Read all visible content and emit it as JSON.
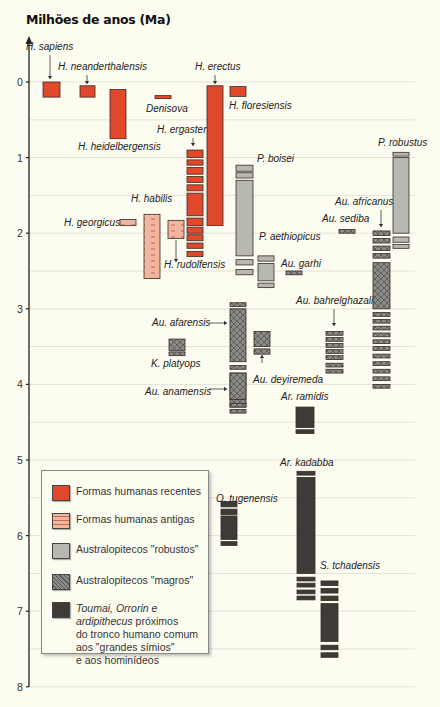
{
  "header": {
    "y_axis_title": "Milhões de anos (Ma)",
    "partial_title_visible": "cut-off red title at top (text not legible)"
  },
  "colors": {
    "background": "#fdfcf0",
    "recent_human": "#e0492c",
    "ancient_human": "#f2b5a0",
    "robust_australopith": "#b8b8b2",
    "gracile_australopith": "#8a8a86",
    "ancestral": "#3e3a38",
    "gridline": "#dcdcd0",
    "axis": "#222222"
  },
  "legend": {
    "items": [
      {
        "key": "recent",
        "label": "Formas humanas recentes"
      },
      {
        "key": "ancient",
        "label": "Formas humanas antigas"
      },
      {
        "key": "robust",
        "label": "Australopitecos \"robustos\""
      },
      {
        "key": "gracile",
        "label": "Australopitecos \"magros\""
      },
      {
        "key": "ancestral",
        "label_lines": [
          "Toumai, Orrorin e",
          "ardipithecus próximos",
          "do tronco humano comum",
          "aos \"grandes símios\"",
          "e aos hominídeos"
        ]
      }
    ]
  },
  "chart_data": {
    "type": "range-bar timeline",
    "title": "",
    "ylabel": "Milhões de anos (Ma)",
    "xlabel": "",
    "ylim": [
      0,
      8
    ],
    "y_inverted": true,
    "y_ticks": [
      "0",
      "1",
      "2",
      "3",
      "4",
      "5",
      "6",
      "7",
      "8"
    ],
    "grid": "horizontal lines every 0.5 Ma",
    "legend_position": "bottom-left inset",
    "species": [
      {
        "name": "H. sapiens",
        "group": "recent",
        "segments": [
          [
            0.0,
            0.2
          ]
        ],
        "label_pos": "above-arrow"
      },
      {
        "name": "H. neanderthalensis",
        "group": "recent",
        "segments": [
          [
            0.05,
            0.2
          ]
        ],
        "label_pos": "above-arrow"
      },
      {
        "name": "H. heidelbergensis",
        "group": "recent",
        "segments": [
          [
            0.1,
            0.75
          ]
        ],
        "label_pos": "below"
      },
      {
        "name": "Denisova",
        "group": "recent",
        "segments": [
          [
            0.18,
            0.22
          ]
        ],
        "label_pos": "below"
      },
      {
        "name": "H. erectus",
        "group": "recent",
        "segments": [
          [
            0.05,
            1.9
          ]
        ],
        "label_pos": "above-arrow"
      },
      {
        "name": "H. floresiensis",
        "group": "recent",
        "segments": [
          [
            0.06,
            0.19
          ]
        ],
        "label_pos": "below"
      },
      {
        "name": "H. ergaster",
        "group": "recent",
        "segments": [
          [
            0.9,
            1.0
          ],
          [
            1.03,
            1.1
          ],
          [
            1.13,
            1.22
          ],
          [
            1.25,
            1.33
          ],
          [
            1.36,
            1.44
          ],
          [
            1.47,
            1.77
          ],
          [
            1.8,
            1.9
          ],
          [
            1.92,
            2.0
          ],
          [
            2.02,
            2.1
          ],
          [
            2.13,
            2.2
          ],
          [
            2.24,
            2.31
          ]
        ],
        "label_pos": "above-arrow"
      },
      {
        "name": "H. habilis",
        "group": "ancient",
        "segments": [
          [
            1.75,
            2.6
          ]
        ],
        "label_pos": "above"
      },
      {
        "name": "H. georgicus",
        "group": "ancient",
        "segments": [
          [
            1.82,
            1.9
          ]
        ],
        "label_pos": "left"
      },
      {
        "name": "H. rudolfensis",
        "group": "ancient",
        "segments": [
          [
            1.83,
            2.07
          ]
        ],
        "label_pos": "below-arrow"
      },
      {
        "name": "P. boisei",
        "group": "robust",
        "segments": [
          [
            1.1,
            1.18
          ],
          [
            1.2,
            1.27
          ],
          [
            1.3,
            2.3
          ],
          [
            2.35,
            2.42
          ],
          [
            2.48,
            2.55
          ]
        ],
        "label_pos": "above"
      },
      {
        "name": "P. aethiopicus",
        "group": "robust",
        "segments": [
          [
            2.3,
            2.37
          ],
          [
            2.4,
            2.63
          ],
          [
            2.66,
            2.72
          ]
        ],
        "label_pos": "above"
      },
      {
        "name": "Au. garhi",
        "group": "gracile",
        "segments": [
          [
            2.5,
            2.55
          ]
        ],
        "label_pos": "right"
      },
      {
        "name": "Au. sediba",
        "group": "gracile",
        "segments": [
          [
            1.95,
            2.0
          ]
        ],
        "label_pos": "above"
      },
      {
        "name": "P. robustus",
        "group": "robust",
        "segments": [
          [
            0.93,
            0.98
          ],
          [
            1.0,
            2.0
          ],
          [
            2.05,
            2.12
          ],
          [
            2.15,
            2.2
          ]
        ],
        "label_pos": "above"
      },
      {
        "name": "Au. africanus",
        "group": "gracile",
        "segments": [
          [
            1.97,
            2.03
          ],
          [
            2.07,
            2.13
          ],
          [
            2.17,
            2.23
          ],
          [
            2.27,
            2.33
          ],
          [
            2.39,
            3.0
          ],
          [
            3.05,
            3.1
          ],
          [
            3.14,
            3.19
          ],
          [
            3.23,
            3.28
          ],
          [
            3.32,
            3.37
          ],
          [
            3.41,
            3.46
          ],
          [
            3.5,
            3.55
          ],
          [
            3.6,
            3.65
          ],
          [
            3.7,
            3.75
          ],
          [
            3.8,
            3.85
          ],
          [
            3.9,
            3.95
          ],
          [
            4.0,
            4.05
          ]
        ],
        "label_pos": "above-arrow"
      },
      {
        "name": "Au. bahrelghazali",
        "group": "gracile",
        "segments": [
          [
            3.3,
            3.35
          ],
          [
            3.38,
            3.43
          ],
          [
            3.46,
            3.51
          ],
          [
            3.54,
            3.59
          ],
          [
            3.62,
            3.67
          ],
          [
            3.72,
            3.77
          ],
          [
            3.8,
            3.85
          ]
        ],
        "label_pos": "above-arrow"
      },
      {
        "name": "Au. afarensis",
        "group": "gracile",
        "segments": [
          [
            2.92,
            2.97
          ],
          [
            3.0,
            3.7
          ],
          [
            3.75,
            3.8
          ],
          [
            3.85,
            4.3
          ]
        ],
        "label_pos": "left-arrow"
      },
      {
        "name": "Au. anamensis",
        "group": "gracile",
        "segments": [
          [
            3.85,
            4.2
          ],
          [
            4.25,
            4.3
          ],
          [
            4.33,
            4.38
          ]
        ],
        "label_pos": "left-arrow"
      },
      {
        "name": "K. platyops",
        "group": "gracile",
        "segments": [
          [
            3.4,
            3.55
          ],
          [
            3.57,
            3.62
          ]
        ],
        "label_pos": "below"
      },
      {
        "name": "Au. deyiremeda",
        "group": "gracile",
        "segments": [
          [
            3.3,
            3.5
          ],
          [
            3.53,
            3.6
          ]
        ],
        "label_pos": "below-arrow"
      },
      {
        "name": "Ar. ramidis",
        "group": "ancestral",
        "segments": [
          [
            4.3,
            4.57
          ],
          [
            4.6,
            4.65
          ]
        ],
        "label_pos": "above"
      },
      {
        "name": "Ar. kadabba",
        "group": "ancestral",
        "segments": [
          [
            5.15,
            5.2
          ],
          [
            5.23,
            6.5
          ],
          [
            6.55,
            6.6
          ],
          [
            6.63,
            6.68
          ],
          [
            6.72,
            6.77
          ],
          [
            6.8,
            6.85
          ]
        ],
        "label_pos": "above"
      },
      {
        "name": "O. tugenensis",
        "group": "ancestral",
        "segments": [
          [
            5.55,
            5.62
          ],
          [
            5.65,
            5.72
          ],
          [
            5.74,
            6.05
          ],
          [
            6.08,
            6.13
          ]
        ],
        "label_pos": "above"
      },
      {
        "name": "S. tchadensis",
        "group": "ancestral",
        "segments": [
          [
            6.6,
            6.66
          ],
          [
            6.7,
            6.76
          ],
          [
            6.8,
            6.86
          ],
          [
            6.9,
            7.4
          ],
          [
            7.45,
            7.51
          ],
          [
            7.55,
            7.61
          ]
        ],
        "label_pos": "above"
      }
    ]
  }
}
